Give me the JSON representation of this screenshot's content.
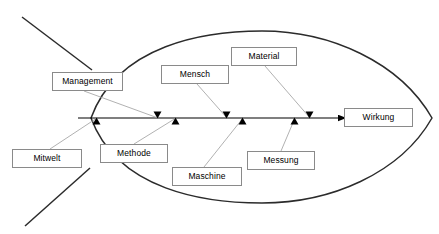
{
  "diagram": {
    "type": "ishikawa-fishbone",
    "title": "",
    "effect": {
      "label": "Wirkung",
      "box": {
        "x": 344,
        "y": 108,
        "w": 69,
        "h": 19
      }
    },
    "spine": {
      "x1": 78,
      "x2": 346,
      "y": 118,
      "color": "#000000"
    },
    "fish_outline_color": "#2b2b2b",
    "connector_color": "#a8a8a8",
    "causes": [
      {
        "label": "Management",
        "side": "top",
        "box": {
          "x": 52,
          "y": 72,
          "w": 71,
          "h": 19
        },
        "connector": {
          "x1": 84,
          "y1": 91,
          "x2": 158,
          "y2": 118
        },
        "arrow_at": {
          "x": 158,
          "y": 118
        }
      },
      {
        "label": "Mensch",
        "side": "top",
        "box": {
          "x": 161,
          "y": 65,
          "w": 68,
          "h": 19
        },
        "connector": {
          "x1": 197,
          "y1": 84,
          "x2": 227,
          "y2": 118
        },
        "arrow_at": {
          "x": 227,
          "y": 118
        }
      },
      {
        "label": "Material",
        "side": "top",
        "box": {
          "x": 231,
          "y": 47,
          "w": 66,
          "h": 19
        },
        "connector": {
          "x1": 265,
          "y1": 66,
          "x2": 310,
          "y2": 118
        },
        "arrow_at": {
          "x": 310,
          "y": 118
        }
      },
      {
        "label": "Mitwelt",
        "side": "bottom",
        "box": {
          "x": 12,
          "y": 149,
          "w": 70,
          "h": 19
        },
        "connector": {
          "x1": 50,
          "y1": 149,
          "x2": 97,
          "y2": 118
        },
        "arrow_at": {
          "x": 97,
          "y": 118
        }
      },
      {
        "label": "Methode",
        "side": "bottom",
        "box": {
          "x": 100,
          "y": 144,
          "w": 68,
          "h": 19
        },
        "connector": {
          "x1": 134,
          "y1": 144,
          "x2": 176,
          "y2": 118
        },
        "arrow_at": {
          "x": 176,
          "y": 118
        }
      },
      {
        "label": "Maschine",
        "side": "bottom",
        "box": {
          "x": 172,
          "y": 167,
          "w": 70,
          "h": 19
        },
        "connector": {
          "x1": 204,
          "y1": 167,
          "x2": 243,
          "y2": 118
        },
        "arrow_at": {
          "x": 243,
          "y": 118
        }
      },
      {
        "label": "Messung",
        "side": "bottom",
        "box": {
          "x": 247,
          "y": 151,
          "w": 68,
          "h": 19
        },
        "connector": {
          "x1": 281,
          "y1": 151,
          "x2": 295,
          "y2": 118
        },
        "arrow_at": {
          "x": 295,
          "y": 118
        }
      }
    ]
  }
}
